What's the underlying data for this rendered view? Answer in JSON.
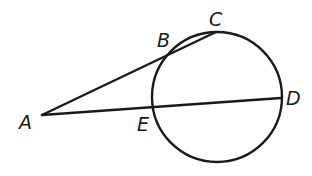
{
  "diagram": {
    "title": "",
    "stroke_color": "#1a1a1a",
    "background": "#ffffff",
    "circle": {
      "cx": 217,
      "cy": 97,
      "r": 65
    },
    "points": {
      "A": {
        "label": "A",
        "x": 42,
        "y": 115
      },
      "B": {
        "label": "B",
        "x": 168,
        "y": 56
      },
      "C": {
        "label": "C",
        "x": 216,
        "y": 32
      },
      "D": {
        "label": "D",
        "x": 281,
        "y": 98
      },
      "E": {
        "label": "E",
        "x": 154,
        "y": 107
      }
    },
    "segments": [
      {
        "from": "A",
        "to": "C",
        "name": "secant-ac"
      },
      {
        "from": "A",
        "to": "D",
        "name": "secant-ad"
      }
    ],
    "labels": {
      "A": {
        "text": "A",
        "x": 19,
        "y": 129
      },
      "B": {
        "text": "B",
        "x": 157,
        "y": 46
      },
      "C": {
        "text": "C",
        "x": 209,
        "y": 25
      },
      "D": {
        "text": "D",
        "x": 286,
        "y": 105
      },
      "E": {
        "text": "E",
        "x": 137,
        "y": 130
      }
    }
  }
}
